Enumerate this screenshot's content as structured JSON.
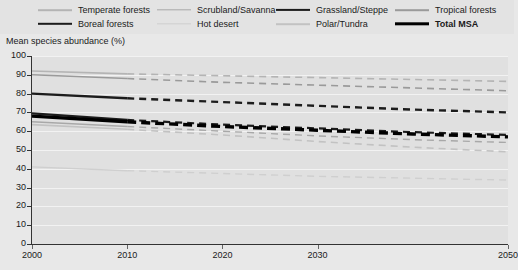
{
  "legend": {
    "items": [
      {
        "label": "Temperate forests",
        "color": "#b4b4b4",
        "width": 1.6,
        "bold": false
      },
      {
        "label": "Scrubland/Savanna",
        "color": "#a8a8a8",
        "width": 1.4,
        "bold": false
      },
      {
        "label": "Grassland/Steppe",
        "color": "#1c1c1c",
        "width": 2.2,
        "bold": false
      },
      {
        "label": "Tropical forests",
        "color": "#9a9a9a",
        "width": 1.6,
        "bold": false
      },
      {
        "label": "Boreal forests",
        "color": "#1c1c1c",
        "width": 2.4,
        "bold": false
      },
      {
        "label": "Hot desert",
        "color": "#cfcfcf",
        "width": 1.4,
        "bold": false
      },
      {
        "label": "Polar/Tundra",
        "color": "#c2c2c2",
        "width": 1.6,
        "bold": false
      },
      {
        "label": "Total MSA",
        "color": "#000000",
        "width": 3.4,
        "bold": true
      }
    ]
  },
  "chart_data": {
    "type": "line",
    "title": "",
    "ylabel": "Mean species abundance (%)",
    "xlabel": "",
    "ylim": [
      0,
      100
    ],
    "xlim": [
      2000,
      2050
    ],
    "yticks": [
      0,
      10,
      20,
      30,
      40,
      50,
      60,
      70,
      80,
      90,
      100
    ],
    "xticks": [
      2000,
      2010,
      2020,
      2030,
      2050
    ],
    "grid": true,
    "legend_position": "top",
    "solid_until": 2010,
    "note": "Lines are solid for historical period 2000-2010 and dashed for the projection 2010-2050.",
    "x": [
      2000,
      2010,
      2020,
      2030,
      2040,
      2050
    ],
    "series": [
      {
        "name": "Temperate forests",
        "color": "#b4b4b4",
        "width": 1.6,
        "values": [
          92,
          90.5,
          89.5,
          88.5,
          87.5,
          86.5
        ]
      },
      {
        "name": "Tropical forests",
        "color": "#9a9a9a",
        "width": 1.6,
        "values": [
          90,
          88,
          86,
          84.5,
          83,
          81.5
        ]
      },
      {
        "name": "Boreal forests",
        "color": "#1c1c1c",
        "width": 2.4,
        "values": [
          80,
          77.5,
          75.5,
          73.5,
          71.5,
          70
        ]
      },
      {
        "name": "Grassland/Steppe",
        "color": "#1c1c1c",
        "width": 2.2,
        "values": [
          69.5,
          66,
          63.5,
          61.5,
          59.5,
          58
        ]
      },
      {
        "name": "Total MSA",
        "color": "#000000",
        "width": 3.4,
        "values": [
          68,
          65,
          62.5,
          60.5,
          58.5,
          57
        ]
      },
      {
        "name": "Scrubland/Savanna",
        "color": "#a8a8a8",
        "width": 1.4,
        "values": [
          65,
          62.5,
          60,
          57.5,
          55.5,
          54
        ]
      },
      {
        "name": "Polar/Tundra",
        "color": "#c2c2c2",
        "width": 1.6,
        "values": [
          63.5,
          61,
          58,
          54.5,
          51.5,
          49
        ]
      },
      {
        "name": "Hot desert",
        "color": "#cfcfcf",
        "width": 1.4,
        "values": [
          41,
          39,
          37.5,
          36,
          35,
          34
        ]
      }
    ]
  }
}
